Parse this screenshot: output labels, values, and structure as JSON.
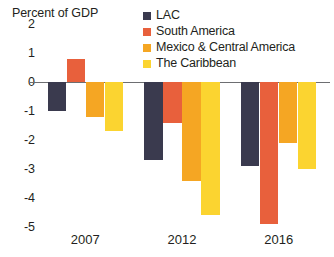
{
  "chart_data": {
    "type": "bar",
    "title": "Percent of GDP",
    "xlabel": "",
    "ylabel": "Percent of GDP",
    "categories": [
      "2007",
      "2012",
      "2016"
    ],
    "ylim": [
      -5,
      2
    ],
    "ytick_labels": [
      "2",
      "1",
      "0",
      "-1",
      "-2",
      "-3",
      "-4",
      "-5"
    ],
    "ytick_values": [
      2,
      1,
      0,
      -1,
      -2,
      -3,
      -4,
      -5
    ],
    "grid": false,
    "legend_position": "top-right",
    "series": [
      {
        "name": "LAC",
        "color": "#3a3a4e",
        "values": [
          -1.0,
          -2.7,
          -2.9
        ]
      },
      {
        "name": "South America",
        "color": "#e8603c",
        "values": [
          0.8,
          -1.4,
          -4.9
        ]
      },
      {
        "name": "Mexico & Central America",
        "color": "#f5a623",
        "values": [
          -1.2,
          -3.4,
          -2.1
        ]
      },
      {
        "name": "The Caribbean",
        "color": "#fbd430",
        "values": [
          -1.7,
          -4.6,
          -3.0
        ]
      }
    ]
  }
}
